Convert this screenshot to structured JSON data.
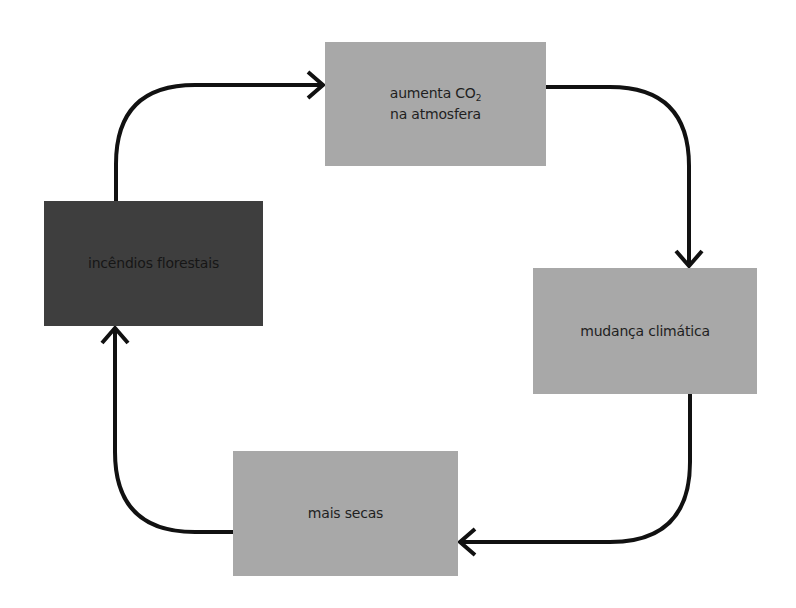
{
  "diagram": {
    "type": "cycle",
    "nodes": [
      {
        "id": "top",
        "line1_text": "aumenta CO",
        "line1_subscript": "2",
        "line2_text": "na atmosfera",
        "full_label": "aumenta CO2 na atmosfera",
        "fill": "#a8a8a8"
      },
      {
        "id": "right",
        "label": "mudança climática",
        "fill": "#a8a8a8"
      },
      {
        "id": "bottom",
        "label": "mais secas",
        "fill": "#a8a8a8"
      },
      {
        "id": "left",
        "label": "incêndios florestais",
        "fill": "#3e3e3e"
      }
    ],
    "edges": [
      {
        "from": "left",
        "to": "top"
      },
      {
        "from": "top",
        "to": "right"
      },
      {
        "from": "right",
        "to": "bottom"
      },
      {
        "from": "bottom",
        "to": "left"
      }
    ],
    "arrow_color": "#111111"
  }
}
